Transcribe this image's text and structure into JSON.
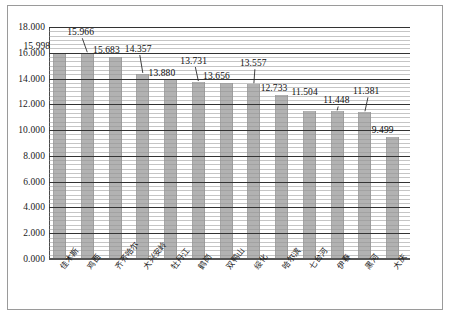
{
  "chart_data": {
    "type": "bar",
    "title": "",
    "xlabel": "",
    "ylabel": "",
    "ylim": [
      0,
      18
    ],
    "ytick_step": 2,
    "grid": true,
    "legend": "none",
    "bar_color": "#b2b2b2",
    "categories": [
      "佳木斯",
      "鸡西",
      "齐齐哈尔",
      "大兴安岭",
      "牡丹江",
      "鹤岗",
      "双鸭山",
      "绥化",
      "哈尔滨",
      "七台河",
      "伊春",
      "黑河",
      "大庆"
    ],
    "values": [
      15.998,
      15.966,
      15.683,
      14.357,
      13.88,
      13.731,
      13.656,
      13.557,
      12.733,
      11.504,
      11.448,
      11.381,
      9.499
    ],
    "value_labels": [
      "15.998",
      "15.966",
      "15.683",
      "14.357",
      "13.880",
      "13.731",
      "13.656",
      "13.557",
      "12.733",
      "11.504",
      "11.448",
      "11.381",
      "9.499"
    ],
    "ytick_labels": [
      "0.000",
      "2.000",
      "4.000",
      "6.000",
      "8.000",
      "10.000",
      "12.000",
      "14.000",
      "16.000",
      "18.000"
    ],
    "ytick_values": [
      0,
      2,
      4,
      6,
      8,
      10,
      12,
      14,
      16,
      18
    ]
  }
}
